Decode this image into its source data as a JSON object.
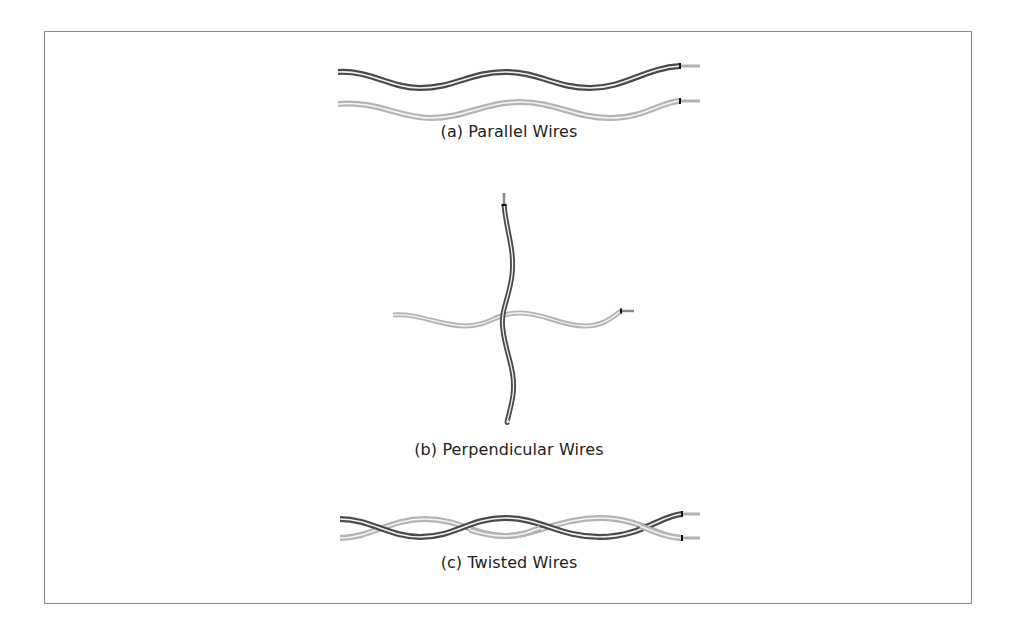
{
  "figure": {
    "panels": [
      {
        "id": "a",
        "caption": "(a) Parallel Wires",
        "wire_count": 2,
        "wire_colors": [
          "dark",
          "light"
        ]
      },
      {
        "id": "b",
        "caption": "(b) Perpendicular Wires",
        "wire_count": 2,
        "wire_colors": [
          "dark",
          "light"
        ]
      },
      {
        "id": "c",
        "caption": "(c) Twisted Wires",
        "wire_count": 2,
        "wire_colors": [
          "dark",
          "light"
        ]
      }
    ],
    "colors": {
      "dark_wire": "#4a4a4a",
      "light_wire": "#b4b4b4",
      "wire_core": "#f4f4f4",
      "conductor_tip": "#c8c8c8",
      "frame_border": "#8a8a8a",
      "caption_text": "#222222"
    }
  }
}
